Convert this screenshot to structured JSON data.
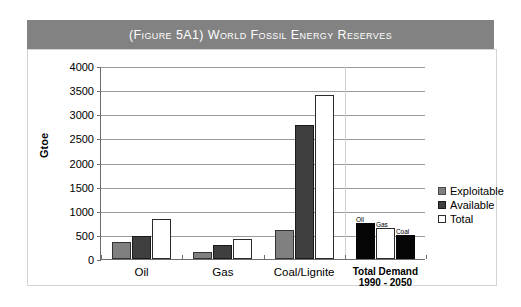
{
  "figure": {
    "title": "(Figure 5A1) World Fossil Energy Reserves",
    "banner_color": "#828282",
    "banner_text_color": "#ffffff"
  },
  "chart_data": {
    "type": "bar",
    "title": "(Figure 5A1) World Fossil Energy Reserves",
    "xlabel": "",
    "ylabel": "Gtoe",
    "ylim": [
      0,
      4000
    ],
    "ytick_step": 500,
    "yticks": [
      0,
      500,
      1000,
      1500,
      2000,
      2500,
      3000,
      3500,
      4000
    ],
    "ytick_labels": [
      "0",
      "500",
      "1000",
      "1500",
      "2000",
      "2500",
      "3000",
      "3500",
      "4000"
    ],
    "grid": true,
    "legend_position": "right",
    "categories": [
      "Oil",
      "Gas",
      "Coal/Lignite",
      "Total Demand 1990 - 2050"
    ],
    "category_labels": [
      {
        "line1": "Oil",
        "line2": ""
      },
      {
        "line1": "Gas",
        "line2": ""
      },
      {
        "line1": "Coal/Lignite",
        "line2": ""
      },
      {
        "line1": "Total Demand",
        "line2": "1990 - 2050"
      }
    ],
    "series": [
      {
        "name": "Exploitable",
        "color": "#808080",
        "values": [
          350,
          145,
          610,
          null
        ]
      },
      {
        "name": "Available",
        "color": "#3f3f3f",
        "values": [
          480,
          290,
          2780,
          null
        ]
      },
      {
        "name": "Total",
        "color": "#ffffff",
        "values": [
          820,
          420,
          3400,
          null
        ]
      }
    ],
    "extra_group": {
      "category": "Total Demand 1990 - 2050",
      "bars": [
        {
          "label": "Oil",
          "value": 750,
          "color": "#050505"
        },
        {
          "label": "Gas",
          "value": 640,
          "color": "#ffffff"
        },
        {
          "label": "Coal",
          "value": 490,
          "color": "#050505"
        }
      ]
    }
  },
  "legend": {
    "items": [
      {
        "label": "Exploitable",
        "swatch": "exploitable"
      },
      {
        "label": "Available",
        "swatch": "available"
      },
      {
        "label": "Total",
        "swatch": "total"
      }
    ]
  }
}
